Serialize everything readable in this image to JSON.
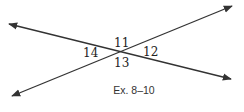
{
  "figure": {
    "caption": "Ex. 8–10",
    "line_color": "#333333",
    "lines": [
      {
        "name": "descending-line",
        "x1": 9,
        "y1": 24,
        "x2": 231,
        "y2": 79
      },
      {
        "name": "ascending-line",
        "x1": 12,
        "y1": 96,
        "x2": 232,
        "y2": 6
      }
    ],
    "angle_labels": {
      "top": "11",
      "right": "12",
      "bottom": "13",
      "left": "14"
    }
  }
}
